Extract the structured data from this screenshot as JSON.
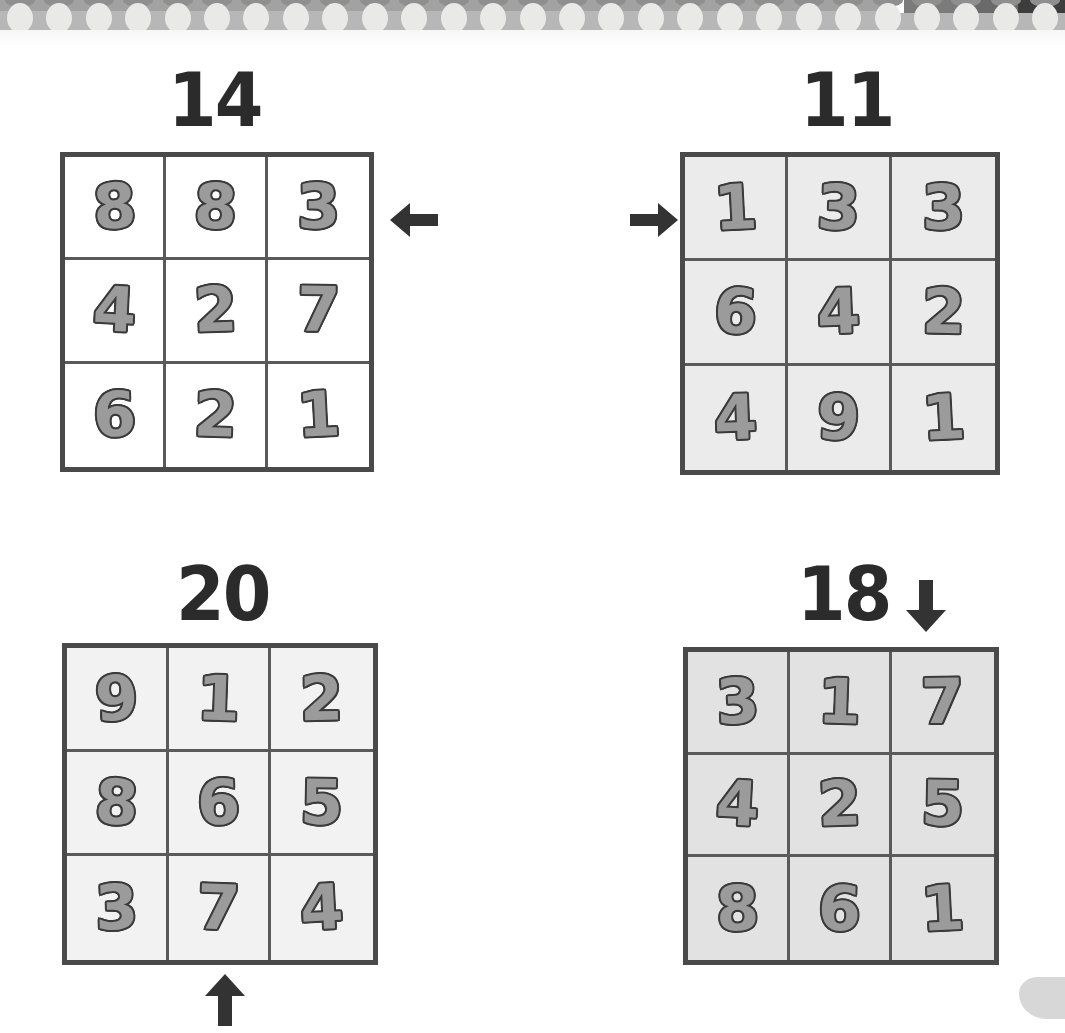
{
  "page": {
    "background_color": "#ffffff",
    "width": 1065,
    "height": 1033
  },
  "decor": {
    "top_strip": {
      "name": "perforated-page-edge",
      "band_color": "#b7b7b7",
      "dot_color": "#e9e9e7",
      "dot_count": 27
    },
    "corner_mark": {
      "name": "bottom-right-smudge",
      "color": "#c9c9c9"
    }
  },
  "style": {
    "digit_fill": "#9b9b9b",
    "digit_outline": "#3a3a3a",
    "grid_border": "#4a4a4a",
    "grid_line": "#5a5a5a",
    "title_color": "#2b2b2b"
  },
  "chart_data": {
    "type": "table",
    "grids": [
      {
        "id": "grid-top-left",
        "title": "14",
        "target_sum": 14,
        "cell_fill": "#ffffff",
        "arrow": {
          "name": "arrow-left-icon",
          "direction": "left",
          "placement": "right-of-row-1",
          "points_at": "row 1"
        },
        "rows": [
          [
            "8",
            "8",
            "3"
          ],
          [
            "4",
            "2",
            "7"
          ],
          [
            "6",
            "2",
            "1"
          ]
        ]
      },
      {
        "id": "grid-top-right",
        "title": "11",
        "target_sum": 11,
        "cell_fill": "#ebebeb",
        "arrow": {
          "name": "arrow-right-icon",
          "direction": "right",
          "placement": "left-of-row-1",
          "points_at": "row 1"
        },
        "rows": [
          [
            "1",
            "3",
            "3"
          ],
          [
            "6",
            "4",
            "2"
          ],
          [
            "4",
            "9",
            "1"
          ]
        ]
      },
      {
        "id": "grid-bottom-left",
        "title": "20",
        "target_sum": 20,
        "cell_fill": "#f2f2f2",
        "arrow": {
          "name": "arrow-up-icon",
          "direction": "up",
          "placement": "below-column-2",
          "points_at": "column 2"
        },
        "rows": [
          [
            "9",
            "1",
            "2"
          ],
          [
            "8",
            "6",
            "5"
          ],
          [
            "3",
            "7",
            "4"
          ]
        ]
      },
      {
        "id": "grid-bottom-right",
        "title": "18",
        "target_sum": 18,
        "cell_fill": "#e2e2e2",
        "arrow": {
          "name": "arrow-down-icon",
          "direction": "down",
          "placement": "above-column-3",
          "points_at": "column 3"
        },
        "rows": [
          [
            "3",
            "1",
            "7"
          ],
          [
            "4",
            "2",
            "5"
          ],
          [
            "8",
            "6",
            "1"
          ]
        ]
      }
    ]
  }
}
